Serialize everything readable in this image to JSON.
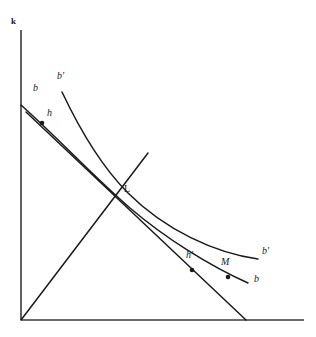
{
  "figure": {
    "kind": "economics-diagram",
    "background_color": "#ffffff",
    "ink_color": "#1a1a1a",
    "axes": {
      "y_axis_label": "k",
      "x_axis_label": "",
      "origin": [
        21,
        320
      ],
      "y_top": [
        21,
        30
      ],
      "x_right": [
        304,
        320
      ]
    },
    "labels": {
      "k": "k",
      "b_upper_left": "b",
      "bprime_upper_left": "b′",
      "h": "h",
      "L": "L",
      "hprime": "h′",
      "M": "M",
      "bprime_right": "b′",
      "b_right": "b"
    },
    "curves": [
      {
        "name": "b-curve",
        "label": "b",
        "description": "lower convex isoquant-like curve from y-axis to lower right",
        "path": "M 21,105 C 60,140 95,178 130,208 C 165,238 210,266 248,283"
      },
      {
        "name": "bprime-curve",
        "label": "b′",
        "description": "upper convex isoquant-like curve starting higher on the left, ending further right",
        "path": "M 62,92 C 80,130 100,165 128,193 C 165,230 215,253 258,259"
      },
      {
        "name": "budget-line",
        "label": "",
        "description": "straight descending line through h, L, h' to x-axis",
        "path": "M 26,112 L 246,320"
      },
      {
        "name": "ray-from-origin",
        "label": "",
        "description": "rising ray from origin through L",
        "path": "M 21,320 L 148,153"
      }
    ],
    "points": [
      {
        "name": "h",
        "label": "h",
        "x": 42,
        "y": 123,
        "dot": true,
        "label_x": 48,
        "label_y": 113
      },
      {
        "name": "L",
        "label": "L",
        "x": 119,
        "y": 193,
        "dot": false,
        "label_x": 124,
        "label_y": 188
      },
      {
        "name": "h'",
        "label": "h′",
        "x": 192,
        "y": 270,
        "dot": true,
        "label_x": 188,
        "label_y": 255
      },
      {
        "name": "M",
        "label": "M",
        "x": 228,
        "y": 277,
        "dot": true,
        "label_x": 222,
        "label_y": 261
      }
    ],
    "curve_labels": [
      {
        "name": "b-upper-left",
        "text": "b",
        "x": 33,
        "y": 88
      },
      {
        "name": "bprime-upper-left",
        "text": "b′",
        "x": 57,
        "y": 76
      },
      {
        "name": "bprime-right",
        "text": "b′",
        "x": 262,
        "y": 251
      },
      {
        "name": "b-right",
        "text": "b",
        "x": 254,
        "y": 279
      }
    ]
  }
}
